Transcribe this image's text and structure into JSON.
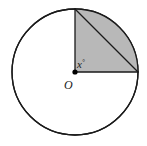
{
  "figure": {
    "canvas": {
      "width": 147,
      "height": 146,
      "background_color": "#ffffff"
    },
    "colors": {
      "stroke": "#1a1a1a",
      "shaded_fill": "#b8b8b8",
      "circle_fill": "#ffffff",
      "label_color": "#1a1a1a",
      "center_dot": "#000000"
    },
    "circle": {
      "center_x": 75,
      "center_y": 72,
      "radius": 63,
      "stroke_width": 1.3
    },
    "sector": {
      "description": "shaded quarter sector from top (12 o'clock) clockwise to right (3 o'clock)",
      "start_angle_deg": 90,
      "end_angle_deg": 0,
      "sweep_deg": 90,
      "fill": "#b8b8b8"
    },
    "points": {
      "center": {
        "x": 75,
        "y": 72
      },
      "top": {
        "x": 75,
        "y": 9
      },
      "right": {
        "x": 138,
        "y": 72
      }
    },
    "segments": [
      {
        "name": "vertical-radius",
        "from": "center",
        "to": "top"
      },
      {
        "name": "horizontal-radius",
        "from": "center",
        "to": "right"
      },
      {
        "name": "chord-hypotenuse",
        "from": "top",
        "to": "right"
      }
    ],
    "center_dot_radius": 2.6,
    "labels": {
      "angle": {
        "text": "x",
        "degree_symbol": "°",
        "x": 77,
        "y": 68
      },
      "center": {
        "text": "O",
        "x": 64,
        "y": 89
      }
    }
  }
}
